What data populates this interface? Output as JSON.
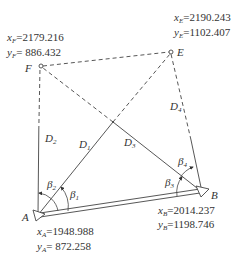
{
  "points": {
    "F": {
      "label": "F",
      "x_label": "x",
      "x_sub": "F",
      "x_value": "=2179.216",
      "y_label": "y",
      "y_sub": "F",
      "y_value": "= 886.432"
    },
    "E": {
      "label": "E",
      "x_label": "x",
      "x_sub": "E",
      "x_value": "=2190.243",
      "y_label": "y",
      "y_sub": "E",
      "y_value": "=1102.407"
    },
    "A": {
      "label": "A",
      "x_label": "x",
      "x_sub": "A",
      "x_value": "=1948.988",
      "y_label": "y",
      "y_sub": "A",
      "y_value": "= 872.258"
    },
    "B": {
      "label": "B",
      "x_label": "x",
      "x_sub": "B",
      "x_value": "=2014.237",
      "y_label": "y",
      "y_sub": "B",
      "y_value": "=1198.746"
    }
  },
  "distances": [
    {
      "name": "D",
      "sub": "1"
    },
    {
      "name": "D",
      "sub": "2"
    },
    {
      "name": "D",
      "sub": "3"
    },
    {
      "name": "D",
      "sub": "4"
    }
  ],
  "angles": [
    {
      "name": "β",
      "sub": "1"
    },
    {
      "name": "β",
      "sub": "2"
    },
    {
      "name": "β",
      "sub": "3"
    },
    {
      "name": "β",
      "sub": "4"
    }
  ]
}
